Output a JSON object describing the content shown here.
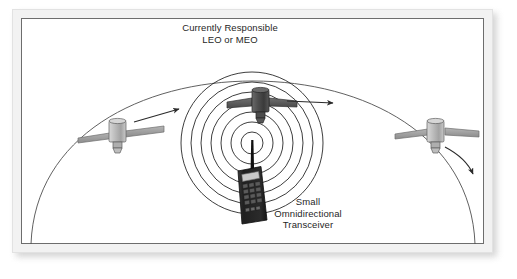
{
  "figure": {
    "background_color": "#ffffff",
    "frame_color": "#f2f2f2",
    "border_color": "#6d6d6d"
  },
  "labels": {
    "satellite_title_line1": "Currently Responsible",
    "satellite_title_line2": "LEO or MEO",
    "transceiver_line1": "Small",
    "transceiver_line2": "Omnidirectional",
    "transceiver_line3": "Transceiver"
  },
  "diagram": {
    "type": "satellite-communication-handoff",
    "earth_arc": {
      "name": "earth-horizon-arc",
      "color": "#555555"
    },
    "signal_rings": {
      "name": "omnidirectional-signal-rings",
      "count": 7,
      "color": "#1a1a1a",
      "center_x": 231,
      "center_y": 125
    },
    "satellites": [
      {
        "name": "satellite-left",
        "role": "incoming",
        "body_color": "#b0b0b0",
        "panel_color": "#8a8a8a",
        "x": 88,
        "y": 115
      },
      {
        "name": "satellite-center",
        "role": "currently-responsible",
        "body_color": "#4a4a4a",
        "panel_color": "#595959",
        "x": 239,
        "y": 88
      },
      {
        "name": "satellite-right",
        "role": "outgoing",
        "body_color": "#b0b0b0",
        "panel_color": "#8a8a8a",
        "x": 406,
        "y": 116
      }
    ],
    "motion_arrows": [
      {
        "name": "arrow-left-satellite-path",
        "direction": "up-right"
      },
      {
        "name": "arrow-center-satellite-path",
        "direction": "right"
      },
      {
        "name": "arrow-right-satellite-path",
        "direction": "down-right"
      }
    ],
    "transceiver": {
      "name": "handheld-transceiver",
      "body_color": "#2b2b2b",
      "screen_color": "#cccccc",
      "key_color": "#555555",
      "keypad_rows": 4,
      "keypad_cols": 3,
      "function_keys": 3,
      "antenna_color": "#111111"
    }
  }
}
